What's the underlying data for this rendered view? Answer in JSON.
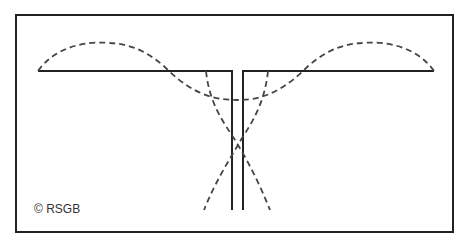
{
  "diagram": {
    "credit": "© RSGB",
    "colors": {
      "line": "#222222",
      "dashed": "#444444",
      "background": "#ffffff"
    }
  }
}
